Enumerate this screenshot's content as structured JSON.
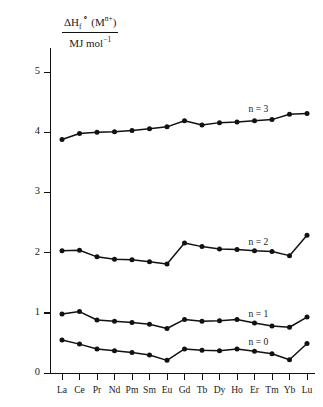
{
  "chart_data": {
    "type": "line",
    "title": "",
    "ylabel_numerator": "ΔH°f (Mⁿ⁺)",
    "ylabel_denominator": "MJ mol⁻¹",
    "xlabel": "",
    "categories": [
      "La",
      "Ce",
      "Pr",
      "Nd",
      "Pm",
      "Sm",
      "Eu",
      "Gd",
      "Tb",
      "Dy",
      "Ho",
      "Er",
      "Tm",
      "Yb",
      "Lu"
    ],
    "ylim": [
      0,
      5.4
    ],
    "yticks": [
      0,
      1,
      2,
      3,
      4,
      5
    ],
    "ytick_labels": [
      "0",
      "1",
      "2",
      "3",
      "4",
      "5"
    ],
    "grid": false,
    "legend_position": "inline-right",
    "marker": "filled-circle",
    "line_color": "#111111",
    "series": [
      {
        "name": "n = 3",
        "label": "n = 3",
        "values": [
          3.88,
          3.98,
          4.0,
          4.01,
          4.03,
          4.06,
          4.09,
          4.19,
          4.12,
          4.16,
          4.17,
          4.19,
          4.21,
          4.3,
          4.31
        ]
      },
      {
        "name": "n = 2",
        "label": "n = 2",
        "values": [
          2.03,
          2.04,
          1.93,
          1.89,
          1.88,
          1.85,
          1.81,
          2.16,
          2.1,
          2.06,
          2.05,
          2.03,
          2.02,
          1.95,
          2.29
        ]
      },
      {
        "name": "n = 1",
        "label": "n = 1",
        "values": [
          0.98,
          1.02,
          0.88,
          0.86,
          0.84,
          0.81,
          0.74,
          0.89,
          0.86,
          0.87,
          0.89,
          0.83,
          0.78,
          0.76,
          0.93
        ]
      },
      {
        "name": "n = 0",
        "label": "n = 0",
        "values": [
          0.55,
          0.48,
          0.4,
          0.37,
          0.34,
          0.3,
          0.21,
          0.4,
          0.38,
          0.37,
          0.4,
          0.36,
          0.32,
          0.22,
          0.49
        ]
      }
    ]
  }
}
